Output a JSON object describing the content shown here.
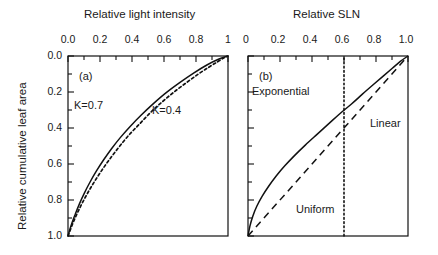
{
  "figure": {
    "y_axis_title": "Relative cumulative leaf area",
    "panels": [
      {
        "tag": "(a)",
        "x_axis_title": "Relative light intensity",
        "x_ticklabels": [
          "0.0",
          "0.2",
          "0.4",
          "0.6",
          "0.8",
          "1"
        ],
        "y_ticklabels": [
          "0.0",
          "0.2",
          "0.4",
          "0.6",
          "0.8",
          "1.0"
        ],
        "annotations": [
          {
            "text": "K=0.7"
          },
          {
            "text": "K=0.4"
          }
        ]
      },
      {
        "tag": "(b)",
        "x_axis_title": "Relative SLN",
        "x_ticklabels": [
          "0",
          "0.2",
          "0.4",
          "0.6",
          "0.8",
          "1.0"
        ],
        "annotations": [
          {
            "text": "Exponential"
          },
          {
            "text": "Linear"
          },
          {
            "text": "Uniform"
          }
        ]
      }
    ]
  },
  "chart_data": [
    {
      "type": "line",
      "panel": "(a)",
      "title": "Relative light intensity",
      "xlabel": "Relative light intensity",
      "ylabel": "Relative cumulative leaf area",
      "xlim": [
        0,
        1
      ],
      "ylim": [
        0,
        1
      ],
      "y_inverted": true,
      "grid": false,
      "legend": "inline-annotations",
      "xticks": [
        0,
        0.2,
        0.4,
        0.6,
        0.8,
        1.0
      ],
      "xticklabels": [
        "0.0",
        "0.2",
        "0.4",
        "0.6",
        "0.8",
        "1"
      ],
      "yticks": [
        0,
        0.2,
        0.4,
        0.6,
        0.8,
        1.0
      ],
      "yticklabels": [
        "0.0",
        "0.2",
        "0.4",
        "0.6",
        "0.8",
        "1.0"
      ],
      "series": [
        {
          "name": "K=0.7",
          "style": "dotted",
          "note": "Relative light intensity vs relative cumulative leaf area, Beer-Lambert extinction, K=0.7",
          "x": [
            0.0,
            0.03,
            0.065,
            0.105,
            0.15,
            0.2,
            0.255,
            0.315,
            0.38,
            0.45,
            0.52,
            0.595,
            0.67,
            0.745,
            0.815,
            0.88,
            0.935,
            0.975,
            1.0
          ],
          "y": [
            1.0,
            0.93,
            0.86,
            0.79,
            0.72,
            0.65,
            0.58,
            0.51,
            0.44,
            0.375,
            0.31,
            0.25,
            0.195,
            0.145,
            0.1,
            0.062,
            0.032,
            0.01,
            0.0
          ]
        },
        {
          "name": "K=0.4",
          "style": "solid",
          "note": "Relative light intensity vs relative cumulative leaf area, Beer-Lambert extinction, K=0.4",
          "x": [
            0.0,
            0.02,
            0.045,
            0.072,
            0.103,
            0.138,
            0.177,
            0.222,
            0.272,
            0.328,
            0.39,
            0.458,
            0.532,
            0.612,
            0.698,
            0.785,
            0.868,
            0.94,
            1.0
          ],
          "y": [
            1.0,
            0.94,
            0.88,
            0.82,
            0.76,
            0.7,
            0.64,
            0.578,
            0.515,
            0.452,
            0.39,
            0.328,
            0.266,
            0.205,
            0.148,
            0.095,
            0.05,
            0.018,
            0.0
          ]
        }
      ]
    },
    {
      "type": "line",
      "panel": "(b)",
      "title": "Relative SLN",
      "xlabel": "Relative SLN",
      "ylabel": "Relative cumulative leaf area",
      "xlim": [
        0,
        1
      ],
      "ylim": [
        0,
        1
      ],
      "y_inverted": true,
      "grid": false,
      "legend": "inline-annotations",
      "xticks": [
        0,
        0.2,
        0.4,
        0.6,
        0.8,
        1.0
      ],
      "xticklabels": [
        "0",
        "0.2",
        "0.4",
        "0.6",
        "0.8",
        "1.0"
      ],
      "series": [
        {
          "name": "Exponential",
          "style": "solid",
          "note": "Exponential SLN profile: concave curve from (0,1) to (1,0)",
          "x": [
            0.0,
            0.012,
            0.03,
            0.055,
            0.088,
            0.128,
            0.175,
            0.23,
            0.292,
            0.358,
            0.428,
            0.5,
            0.572,
            0.645,
            0.715,
            0.782,
            0.845,
            0.902,
            0.952,
            1.0
          ],
          "y": [
            1.0,
            0.945,
            0.89,
            0.835,
            0.78,
            0.725,
            0.668,
            0.61,
            0.552,
            0.495,
            0.438,
            0.38,
            0.322,
            0.268,
            0.212,
            0.16,
            0.112,
            0.068,
            0.03,
            0.0
          ]
        },
        {
          "name": "Linear",
          "style": "dashed",
          "note": "Linear SLN profile: straight line from (0,1) to (1,0)",
          "x": [
            0.0,
            1.0
          ],
          "y": [
            1.0,
            0.0
          ]
        },
        {
          "name": "Uniform",
          "style": "dotted-vertical",
          "note": "Uniform SLN profile: constant relative SLN of 0.6 at all depths",
          "x": [
            0.6,
            0.6
          ],
          "y": [
            1.0,
            0.0
          ]
        }
      ]
    }
  ]
}
